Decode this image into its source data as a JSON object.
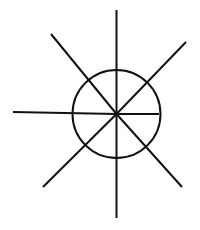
{
  "diagram": {
    "type": "radial-lines-with-circle",
    "width": 200,
    "height": 230,
    "background": "#ffffff",
    "stroke_color": "#111111",
    "stroke_width": 2,
    "center": {
      "x": 116.5,
      "y": 114
    },
    "circle": {
      "cx": 116.5,
      "cy": 114,
      "r": 44
    },
    "rays": [
      {
        "name": "ray-up",
        "x1": 116.5,
        "y1": 114,
        "x2": 116.5,
        "y2": 10
      },
      {
        "name": "ray-down",
        "x1": 116.5,
        "y1": 114,
        "x2": 116.5,
        "y2": 218
      },
      {
        "name": "ray-left",
        "x1": 116.5,
        "y1": 114,
        "x2": 13,
        "y2": 112
      },
      {
        "name": "ray-right",
        "x1": 116.5,
        "y1": 114,
        "x2": 159,
        "y2": 114
      },
      {
        "name": "ray-up-left",
        "x1": 116.5,
        "y1": 114,
        "x2": 51,
        "y2": 34
      },
      {
        "name": "ray-up-right",
        "x1": 116.5,
        "y1": 114,
        "x2": 186,
        "y2": 42
      },
      {
        "name": "ray-down-left",
        "x1": 116.5,
        "y1": 114,
        "x2": 43,
        "y2": 187
      },
      {
        "name": "ray-down-right",
        "x1": 116.5,
        "y1": 114,
        "x2": 182,
        "y2": 187
      }
    ]
  }
}
